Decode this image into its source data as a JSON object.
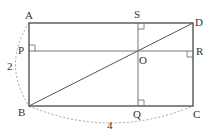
{
  "diagram": {
    "type": "geometry",
    "points": {
      "A": {
        "label": "A",
        "x": 29,
        "y": 23
      },
      "D": {
        "label": "D",
        "x": 193,
        "y": 23
      },
      "B": {
        "label": "B",
        "x": 29,
        "y": 106
      },
      "C": {
        "label": "C",
        "x": 193,
        "y": 106
      },
      "S": {
        "label": "S",
        "x": 138,
        "y": 23
      },
      "Q": {
        "label": "Q",
        "x": 138,
        "y": 106
      },
      "P": {
        "label": "P",
        "x": 29,
        "y": 51
      },
      "R": {
        "label": "R",
        "x": 193,
        "y": 51
      },
      "O": {
        "label": "O",
        "x": 138,
        "y": 51
      }
    },
    "dimensions": {
      "side_ab": "2",
      "side_bc": "4"
    },
    "colors": {
      "line": "#555555",
      "dashed": "#888888",
      "text": "#333333"
    }
  }
}
